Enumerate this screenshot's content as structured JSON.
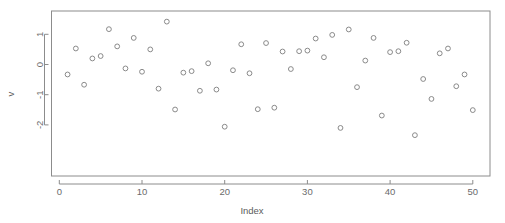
{
  "chart_data": {
    "type": "scatter",
    "title": "",
    "xlabel": "Index",
    "ylabel": "v",
    "xlim": [
      -0.6,
      52.0
    ],
    "ylim": [
      -2.5,
      1.6
    ],
    "xticks": [
      0,
      10,
      20,
      30,
      40,
      50
    ],
    "yticks": [
      1,
      0,
      -1,
      -2
    ],
    "xtick_labels": [
      "0",
      "10",
      "20",
      "30",
      "40",
      "50"
    ],
    "ytick_labels": [
      "1",
      "0",
      "-1",
      "-2"
    ],
    "grid": false,
    "legend": null,
    "marker": "open-circle",
    "marker_color": "#8a8a8a",
    "frame_color": "#8c8c8c",
    "x": [
      1,
      2,
      3,
      4,
      5,
      6,
      7,
      8,
      9,
      10,
      11,
      12,
      13,
      14,
      15,
      16,
      17,
      18,
      19,
      20,
      21,
      22,
      23,
      24,
      25,
      26,
      27,
      28,
      29,
      30,
      31,
      32,
      33,
      34,
      35,
      36,
      37,
      38,
      39,
      40,
      41,
      42,
      43,
      44,
      45,
      46,
      47,
      48,
      49,
      50
    ],
    "y": [
      -0.33,
      0.53,
      -0.67,
      0.2,
      0.28,
      1.17,
      0.6,
      -0.13,
      0.88,
      -0.24,
      0.5,
      -0.8,
      1.42,
      -1.49,
      -0.27,
      -0.22,
      -0.87,
      0.04,
      -0.83,
      -2.06,
      -0.19,
      0.67,
      -0.29,
      -1.48,
      0.71,
      -1.43,
      0.43,
      -0.15,
      0.44,
      0.46,
      0.86,
      0.24,
      0.98,
      -2.1,
      1.16,
      -0.75,
      0.13,
      0.88,
      -1.69,
      0.41,
      0.44,
      0.72,
      -2.34,
      -0.48,
      -1.14,
      0.37,
      0.53,
      -0.72,
      -0.33,
      -1.51
    ]
  },
  "figure": {
    "width": 505,
    "height": 223,
    "background": "#ffffff"
  }
}
